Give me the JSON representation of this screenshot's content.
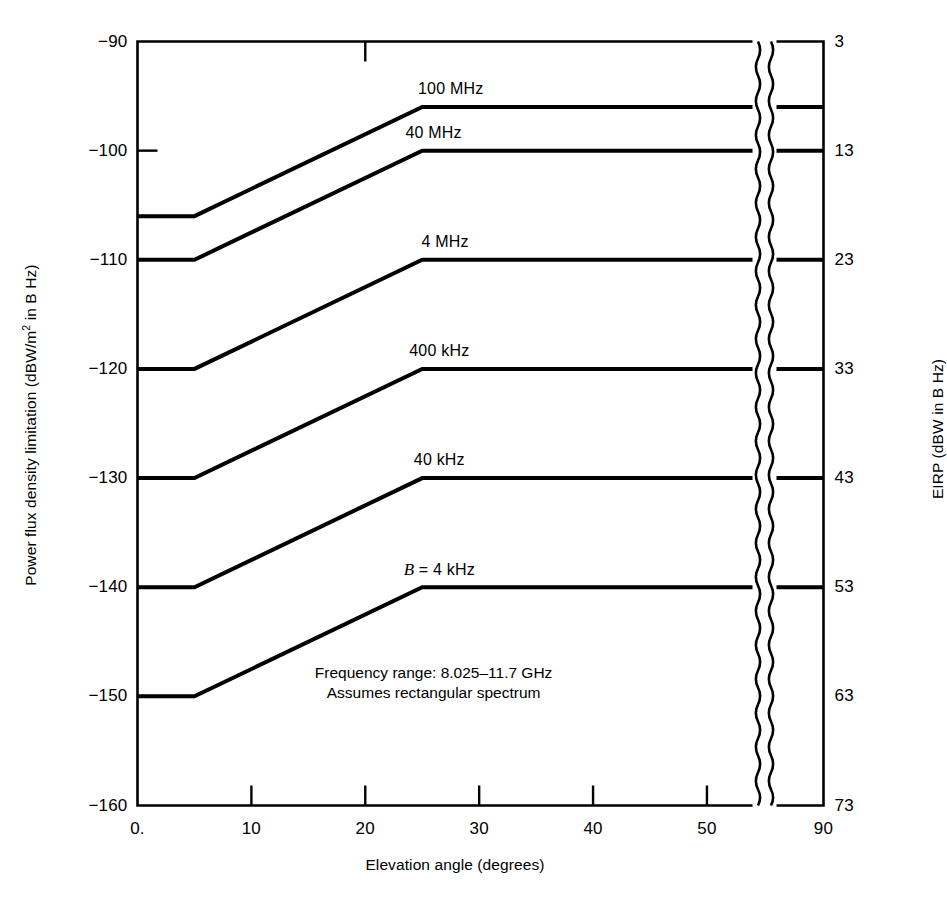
{
  "chart_data": {
    "type": "line",
    "title": "",
    "xlabel": "Elevation angle (degrees)",
    "ylabel": "Power flux density limitation (dBW/m² in B Hz)",
    "ylabel_right": "EIRP (dBW in B Hz)",
    "xlim": [
      0,
      90
    ],
    "ylim": [
      -160,
      -90
    ],
    "ylim_right": [
      3,
      73
    ],
    "grid": false,
    "legend": "inline-curve-labels",
    "x_ticks": [
      "0.",
      "10",
      "20",
      "30",
      "40",
      "50",
      "90"
    ],
    "x_tick_values": [
      0,
      10,
      20,
      30,
      40,
      50,
      90
    ],
    "y_ticks_left": [
      "−90",
      "−100",
      "−110",
      "−120",
      "−130",
      "−140",
      "−150",
      "−160"
    ],
    "y_tick_values_left": [
      -90,
      -100,
      -110,
      -120,
      -130,
      -140,
      -150,
      -160
    ],
    "y_ticks_right": [
      "73",
      "63",
      "53",
      "43",
      "33",
      "23",
      "13",
      "3"
    ],
    "y_tick_values_right": [
      73,
      63,
      53,
      43,
      33,
      23,
      13,
      3
    ],
    "axis_break": {
      "at_x": 54,
      "style": "wavy-double-line",
      "note": "x axis broken between 54° and 90°"
    },
    "x_breakpoints": [
      0,
      5,
      25,
      90
    ],
    "series": [
      {
        "name": "100 MHz",
        "label": "100 MHz",
        "values": [
          -106,
          -106,
          -96,
          -96
        ],
        "label_x": 27.5,
        "plateau_eirp": 68
      },
      {
        "name": "40 MHz",
        "label": "40 MHz",
        "values": [
          -110,
          -110,
          -100,
          -100
        ],
        "label_x": 26.0,
        "plateau_eirp": 63
      },
      {
        "name": "4 MHz",
        "label": "4 MHz",
        "values": [
          -120,
          -120,
          -110,
          -110
        ],
        "label_x": 27.0,
        "plateau_eirp": 53
      },
      {
        "name": "400 kHz",
        "label": "400 kHz",
        "values": [
          -130,
          -130,
          -120,
          -120
        ],
        "label_x": 26.5,
        "plateau_eirp": 43
      },
      {
        "name": "40 kHz",
        "label": "40 kHz",
        "values": [
          -140,
          -140,
          -130,
          -130
        ],
        "label_x": 26.5,
        "plateau_eirp": 33
      },
      {
        "name": "B = 4 kHz",
        "label": "B = 4 kHz",
        "label_italic_prefix": "B",
        "label_rest": " = 4 kHz",
        "values": [
          -150,
          -150,
          -140,
          -140
        ],
        "label_x": 26.5,
        "plateau_eirp": 23
      }
    ],
    "annotations": [
      {
        "line1": "Frequency range: 8.025–11.7 GHz",
        "line2": "Assumes rectangular spectrum",
        "x": 26.0,
        "y": -148
      }
    ]
  }
}
